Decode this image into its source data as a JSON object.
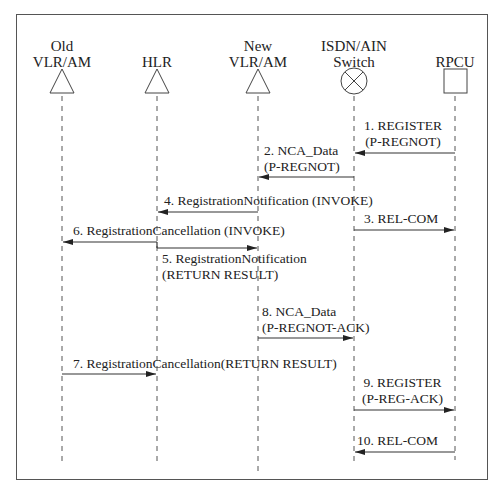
{
  "diagram": {
    "type": "sequence",
    "actors": [
      {
        "id": "old_vlr",
        "label": "Old\nVLR/AM",
        "shape": "triangle",
        "x": 62
      },
      {
        "id": "hlr",
        "label": "HLR",
        "shape": "triangle",
        "x": 157
      },
      {
        "id": "new_vlr",
        "label": "New\nVLR/AM",
        "shape": "triangle",
        "x": 258
      },
      {
        "id": "switch",
        "label": "ISDN/AIN\nSwitch",
        "shape": "circle-x",
        "x": 354
      },
      {
        "id": "rpcu",
        "label": "RPCU",
        "shape": "square",
        "x": 455
      }
    ],
    "messages": [
      {
        "num": 1,
        "text": "1. REGISTER\n(P-REGNOT)",
        "from": "rpcu",
        "to": "switch"
      },
      {
        "num": 2,
        "text": "2. NCA_Data\n(P-REGNOT)",
        "from": "switch",
        "to": "new_vlr"
      },
      {
        "num": 3,
        "text": "3. REL-COM",
        "from": "switch",
        "to": "rpcu"
      },
      {
        "num": 4,
        "text": "4. RegistrationNotification (INVOKE)",
        "from": "new_vlr",
        "to": "hlr"
      },
      {
        "num": 5,
        "text": "5. RegistrationNotification\n(RETURN RESULT)",
        "from": "hlr",
        "to": "new_vlr"
      },
      {
        "num": 6,
        "text": "6. RegistrationCancellation (INVOKE)",
        "from": "hlr",
        "to": "old_vlr"
      },
      {
        "num": 7,
        "text": "7. RegistrationCancellation(RETURN RESULT)",
        "from": "old_vlr",
        "to": "hlr"
      },
      {
        "num": 8,
        "text": "8. NCA_Data\n(P-REGNOT-ACK)",
        "from": "new_vlr",
        "to": "switch"
      },
      {
        "num": 9,
        "text": "9. REGISTER\n(P-REG-ACK)",
        "from": "switch",
        "to": "rpcu"
      },
      {
        "num": 10,
        "text": "10. REL-COM",
        "from": "rpcu",
        "to": "switch"
      }
    ]
  }
}
